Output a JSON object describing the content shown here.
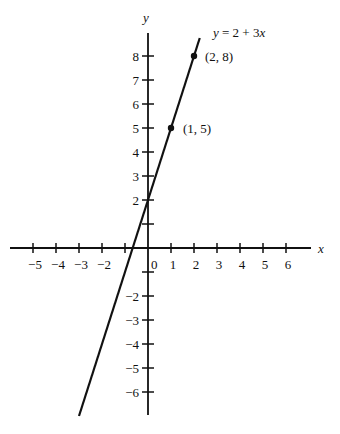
{
  "chart_data": {
    "type": "line",
    "title": "",
    "xlabel": "x",
    "ylabel": "y",
    "xlim": [
      -6,
      7
    ],
    "ylim": [
      -7,
      9
    ],
    "grid": false,
    "x_ticks": [
      -5,
      -4,
      -3,
      -2,
      -1,
      0,
      1,
      2,
      3,
      4,
      5,
      6
    ],
    "x_tick_labels": [
      "−5",
      "−4",
      "−3",
      "−2",
      "",
      "0",
      "1",
      "2",
      "3",
      "4",
      "5",
      "6"
    ],
    "y_ticks": [
      8,
      7,
      6,
      5,
      4,
      3,
      2,
      1,
      -1,
      -2,
      -3,
      -4,
      -5,
      -6
    ],
    "y_tick_labels": [
      "8",
      "7",
      "6",
      "5",
      "4",
      "3",
      "2",
      "",
      "",
      "−2",
      "−3",
      "−4",
      "−5",
      "−6"
    ],
    "series": [
      {
        "name": "y = 2 + 3x",
        "equation": "y = 2 + 3x",
        "slope": 3,
        "intercept": 2,
        "x_range": [
          -3,
          2.25
        ]
      }
    ],
    "points": [
      {
        "x": 0,
        "y": 2,
        "label": ""
      },
      {
        "x": 1,
        "y": 5,
        "label": "(1, 5)"
      },
      {
        "x": 2,
        "y": 8,
        "label": "(2, 8)"
      }
    ],
    "annotations": [
      {
        "text": "y = 2 + 3x",
        "anchor": "line-top"
      },
      {
        "text": "(2, 8)",
        "anchor": "point-2-8"
      },
      {
        "text": "(1, 5)",
        "anchor": "point-1-5"
      }
    ]
  },
  "labels": {
    "x_axis": "x",
    "y_axis": "y",
    "equation": "y = 2 + 3x",
    "point_2_8": "(2, 8)",
    "point_1_5": "(1, 5)",
    "origin": "0"
  }
}
